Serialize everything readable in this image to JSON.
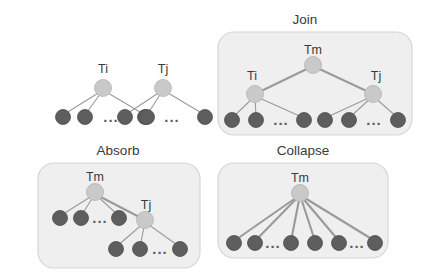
{
  "figure": {
    "type": "tree-transformation-diagram",
    "background_color": "#ffffff",
    "colors": {
      "panel_fill": "#efefef",
      "panel_border": "#d6d6d6",
      "internal_node": "#c9c9c9",
      "leaf_node": "#5e5e5e",
      "edge": "#9a9a9a",
      "text": "#3a3a3a"
    },
    "ellipsis_glyph": "...",
    "panels": [
      {
        "id": "input",
        "title": "",
        "has_box": false,
        "trees": [
          {
            "root_label": "Ti",
            "leaf_count": 3,
            "ellipsis_after_leaf": 2
          },
          {
            "root_label": "Tj",
            "leaf_count": 3,
            "ellipsis_after_leaf": 2
          }
        ]
      },
      {
        "id": "join",
        "title": "Join",
        "has_box": true,
        "root_label": "Tm",
        "children": [
          {
            "label": "Ti",
            "leaf_count": 3,
            "ellipsis_after_leaf": 2
          },
          {
            "label": "Tj",
            "leaf_count": 3,
            "ellipsis_after_leaf": 2
          }
        ]
      },
      {
        "id": "absorb",
        "title": "Absorb",
        "has_box": true,
        "root_label": "Tm",
        "root_leaf_count": 3,
        "root_ellipsis_after_leaf": 2,
        "absorbed": {
          "label": "Tj",
          "leaf_count": 3,
          "ellipsis_after_leaf": 2
        }
      },
      {
        "id": "collapse",
        "title": "Collapse",
        "has_box": true,
        "root_label": "Tm",
        "leaf_count": 6,
        "ellipsis_after_leaves": [
          2,
          5
        ]
      }
    ],
    "labels": {
      "join_title": "Join",
      "absorb_title": "Absorb",
      "collapse_title": "Collapse",
      "ti": "Ti",
      "tj": "Tj",
      "tm": "Tm",
      "ellipsis": "..."
    }
  }
}
